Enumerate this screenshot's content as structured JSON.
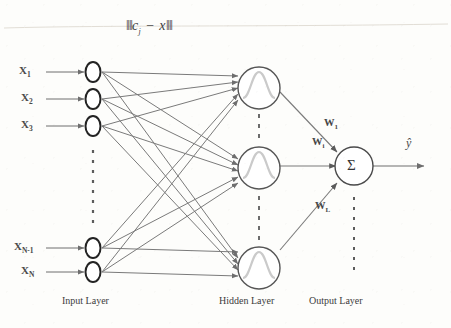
{
  "figure": {
    "title_formula": "‖cⱼ − x‖",
    "formula_parts": {
      "open_bar": "‖",
      "c": "c",
      "c_sub": "j",
      "minus": "−",
      "x": "x",
      "close_bar": "‖"
    },
    "output_symbol": "ŷ",
    "sum_symbol": "Σ",
    "colors": {
      "background": "#fdfdfb",
      "line": "#6e6e6e",
      "node_outline_input": "#2a2a2a",
      "node_outline_hidden": "#555555",
      "node_outline_output": "#4a4a4a",
      "gaussian": "#c9c9c9",
      "text": "#3b3b3b"
    }
  },
  "layers": [
    {
      "id": "input",
      "label": "Input Layer"
    },
    {
      "id": "hidden",
      "label": "Hidden Layer"
    },
    {
      "id": "output",
      "label": "Output Layer"
    }
  ],
  "inputs": [
    {
      "name": "X",
      "sub": "1",
      "label": "X₁"
    },
    {
      "name": "X",
      "sub": "2",
      "label": "X₂"
    },
    {
      "name": "X",
      "sub": "3",
      "label": "X₃"
    },
    {
      "name": "X",
      "sub": "N-1",
      "label": "Xₙ₋₁"
    },
    {
      "name": "X",
      "sub": "N",
      "label": "Xₙ"
    }
  ],
  "input_ellipsis": "⋮",
  "hidden_nodes": [
    {
      "id": "h1",
      "glyph": "gaussian-curve"
    },
    {
      "id": "h2",
      "glyph": "gaussian-curve"
    },
    {
      "id": "h3",
      "glyph": "gaussian-curve"
    }
  ],
  "hidden_ellipsis": "⋮",
  "weights": [
    {
      "name": "W",
      "sub": "1",
      "label": "W₁"
    },
    {
      "name": "W",
      "sub": "i",
      "label": "Wᵢ"
    },
    {
      "name": "W",
      "sub": "L",
      "label": "Wʟ"
    }
  ],
  "output_node": {
    "symbol": "Σ",
    "name": "summation-node"
  },
  "output_ellipsis": "⋮"
}
